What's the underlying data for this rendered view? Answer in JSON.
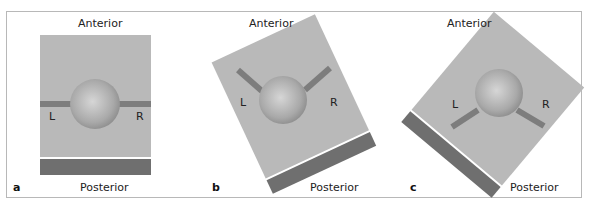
{
  "figure": {
    "panels": [
      {
        "letter": "a",
        "top_label": "Anterior",
        "bottom_label": "Posterior",
        "left_label": "L",
        "right_label": "R",
        "rotation_deg": 0
      },
      {
        "letter": "b",
        "top_label": "Anterior",
        "bottom_label": "Posterior",
        "left_label": "L",
        "right_label": "R",
        "rotation_deg": -25
      },
      {
        "letter": "c",
        "top_label": "Anterior",
        "bottom_label": "Posterior",
        "left_label": "L",
        "right_label": "R",
        "rotation_deg": 40
      }
    ],
    "colors": {
      "field": "#b9b9b9",
      "table_bar": "#6f6f6f",
      "beam": "#7d7d7d",
      "sphere_light": "#d4d4d4",
      "sphere_dark": "#8e8e8e",
      "border": "#b8b8b8"
    }
  }
}
